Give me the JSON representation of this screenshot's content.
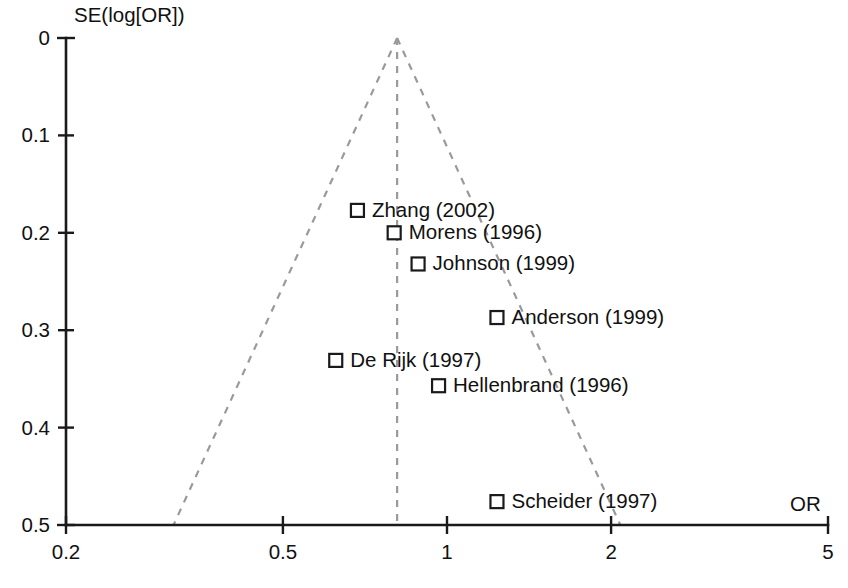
{
  "chart_data": {
    "type": "scatter",
    "title": "",
    "subtitle": "",
    "xlabel": "OR",
    "ylabel": "SE(log[OR])",
    "x_scale": "log",
    "xlim": [
      0.2,
      5
    ],
    "ylim": [
      0,
      0.5
    ],
    "y_inverted": true,
    "grid": false,
    "legend": "none",
    "x_ticks": [
      {
        "label": "0.2",
        "value": 0.2
      },
      {
        "label": "0.5",
        "value": 0.5
      },
      {
        "label": "1",
        "value": 1
      },
      {
        "label": "2",
        "value": 2
      },
      {
        "label": "5",
        "value": 5
      }
    ],
    "y_ticks": [
      {
        "label": "0",
        "value": 0
      },
      {
        "label": "0.1",
        "value": 0.1
      },
      {
        "label": "0.2",
        "value": 0.2
      },
      {
        "label": "0.3",
        "value": 0.3
      },
      {
        "label": "0.4",
        "value": 0.4
      },
      {
        "label": "0.5",
        "value": 0.5
      }
    ],
    "pooled_or": 0.81,
    "funnel_apex": {
      "or": 0.81,
      "se": 0.0
    },
    "funnel_left_base": {
      "or": 0.315,
      "se": 0.5
    },
    "funnel_right_base": {
      "or": 2.08,
      "se": 0.5
    },
    "points": [
      {
        "label": "Zhang (2002)",
        "or": 0.685,
        "se": 0.177,
        "marker": "open-square",
        "label_side": "right"
      },
      {
        "label": "Morens (1996)",
        "or": 0.8,
        "se": 0.2,
        "marker": "open-square",
        "label_side": "right"
      },
      {
        "label": "Johnson (1999)",
        "or": 0.885,
        "se": 0.232,
        "marker": "open-square",
        "label_side": "right"
      },
      {
        "label": "Anderson (1999)",
        "or": 1.235,
        "se": 0.287,
        "marker": "open-square",
        "label_side": "right"
      },
      {
        "label": "De Rijk (1997)",
        "or": 0.625,
        "se": 0.331,
        "marker": "open-square",
        "label_side": "right"
      },
      {
        "label": "Hellenbrand (1996)",
        "or": 0.965,
        "se": 0.357,
        "marker": "open-square",
        "label_side": "right"
      },
      {
        "label": "Scheider (1997)",
        "or": 1.235,
        "se": 0.476,
        "marker": "open-square",
        "label_side": "right"
      }
    ]
  },
  "axes": {
    "y_title": "SE(log[OR])",
    "x_title": "OR",
    "y_tick_labels": [
      "0",
      "0.1",
      "0.2",
      "0.3",
      "0.4",
      "0.5"
    ],
    "x_tick_labels": [
      "0.2",
      "0.5",
      "1",
      "2",
      "5"
    ]
  },
  "studies": [
    {
      "name": "Zhang (2002)"
    },
    {
      "name": "Morens (1996)"
    },
    {
      "name": "Johnson (1999)"
    },
    {
      "name": "Anderson (1999)"
    },
    {
      "name": "De Rijk (1997)"
    },
    {
      "name": "Hellenbrand (1996)"
    },
    {
      "name": "Scheider (1997)"
    }
  ],
  "colors": {
    "axis": "#1a1a1a",
    "funnel_line": "#9a9a9a",
    "marker_stroke": "#1a1a1a",
    "marker_fill": "#ffffff",
    "text": "#111111",
    "background": "#ffffff"
  }
}
